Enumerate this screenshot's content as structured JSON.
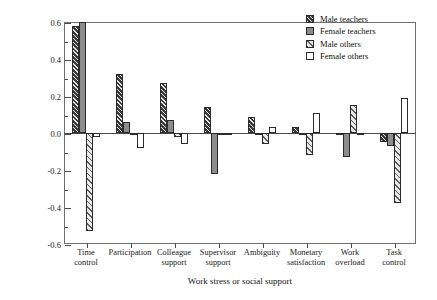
{
  "chart_data": {
    "type": "bar",
    "title": "",
    "xlabel": "Work stress or social support",
    "ylabel": "Stressor presence or support absence (z-scores)",
    "ylim": [
      -0.6,
      0.6
    ],
    "yticks": [
      0.6,
      0.4,
      0.2,
      0.0,
      -0.2,
      -0.4,
      -0.6
    ],
    "ytick_labels": [
      "0.6",
      "0.4",
      "0.2",
      "0.0",
      "-0.2",
      "-0.4",
      "-0.6"
    ],
    "grid": false,
    "legend_position": "top-right",
    "categories": [
      "Time\ncontrol",
      "Participation",
      "Colleague\nsupport",
      "Supervisor\nsupport",
      "Ambiguity",
      "Monetary\nsatisfaction",
      "Work\noverload",
      "Task\ncontrol"
    ],
    "series": [
      {
        "name": "Male teachers",
        "color": "#3a3a3a",
        "pattern": "dark-hatch",
        "values": [
          0.58,
          0.32,
          0.27,
          0.14,
          0.085,
          0.035,
          -0.005,
          -0.05
        ]
      },
      {
        "name": "Female teachers",
        "color": "#8c8c8c",
        "pattern": "solid-gray",
        "values": [
          0.6,
          0.06,
          0.07,
          -0.22,
          -0.01,
          -0.005,
          -0.13,
          -0.07
        ]
      },
      {
        "name": "Male others",
        "color": "#e9e9e9",
        "pattern": "light-hatch",
        "values": [
          -0.53,
          -0.01,
          -0.02,
          -0.01,
          -0.06,
          -0.12,
          0.15,
          -0.38
        ]
      },
      {
        "name": "Female others",
        "color": "#ffffff",
        "pattern": "open",
        "values": [
          -0.02,
          -0.08,
          -0.06,
          0.0,
          0.03,
          0.11,
          -0.01,
          0.19
        ]
      }
    ]
  },
  "legend": {
    "items": [
      {
        "label": "Male teachers"
      },
      {
        "label": "Female teachers"
      },
      {
        "label": "Male others"
      },
      {
        "label": "Female others"
      }
    ]
  }
}
